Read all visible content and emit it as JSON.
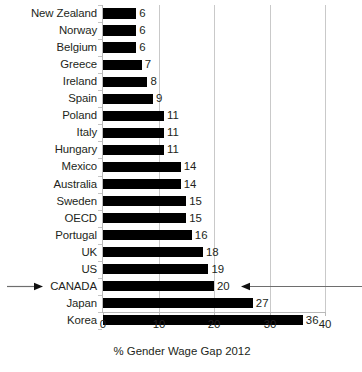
{
  "chart_data": {
    "type": "bar",
    "orientation": "horizontal",
    "title": "",
    "xlabel": "% Gender Wage Gap 2012",
    "ylabel": "",
    "xlim": [
      0,
      40
    ],
    "xticks": [
      0,
      10,
      20,
      30,
      40
    ],
    "grid": true,
    "legend": false,
    "bar_color": "#000000",
    "categories": [
      "New Zealand",
      "Norway",
      "Belgium",
      "Greece",
      "Ireland",
      "Spain",
      "Poland",
      "Italy",
      "Hungary",
      "Mexico",
      "Australia",
      "Sweden",
      "OECD",
      "Portugal",
      "UK",
      "US",
      "CANADA",
      "Japan",
      "Korea"
    ],
    "values": [
      6,
      6,
      6,
      7,
      8,
      9,
      11,
      11,
      11,
      14,
      14,
      15,
      15,
      16,
      18,
      19,
      20,
      27,
      36
    ],
    "data_labels": [
      "6",
      "6",
      "6",
      "7",
      "8",
      "9",
      "11",
      "11",
      "11",
      "14",
      "14",
      "15",
      "15",
      "16",
      "18",
      "19",
      "20",
      "27",
      "36"
    ],
    "highlight_category": "CANADA",
    "annotations": [
      {
        "name": "left-arrow-to-canada",
        "target": "CANADA",
        "direction": "right"
      },
      {
        "name": "right-arrow-to-canada",
        "target": "CANADA",
        "direction": "left"
      }
    ],
    "tick_labels": [
      "0",
      "10",
      "20",
      "30",
      "40"
    ]
  }
}
